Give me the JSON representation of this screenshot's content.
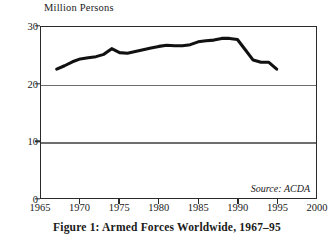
{
  "figure": {
    "caption": "Figure 1: Armed Forces Worldwide, 1967–95",
    "source_note": "Source: ACDA",
    "y_axis_caption": "Million Persons"
  },
  "colors": {
    "line": "#111111",
    "frame": "#2a2a2a",
    "gridline": "#6e6e6e",
    "background": "#ffffff"
  },
  "chart_data": {
    "type": "line",
    "subtitle": "",
    "xlabel": "",
    "ylabel": "Million Persons",
    "annotations": [
      "Source: ACDA"
    ],
    "grid": true,
    "legend": "none",
    "xlim": [
      1965,
      2000
    ],
    "ylim": [
      0,
      30
    ],
    "xticks": [
      1965,
      1970,
      1975,
      1980,
      1985,
      1990,
      1995,
      2000
    ],
    "xtick_labels": [
      "1965",
      "1970",
      "1975",
      "1980",
      "1985",
      "1990",
      "1995",
      "2000"
    ],
    "yticks": [
      0,
      10,
      20,
      30
    ],
    "ytick_labels": [
      "0",
      "10",
      "20",
      "30"
    ],
    "x": [
      1967,
      1968,
      1969,
      1970,
      1971,
      1972,
      1973,
      1974,
      1975,
      1976,
      1977,
      1978,
      1979,
      1980,
      1981,
      1982,
      1983,
      1984,
      1985,
      1986,
      1987,
      1988,
      1989,
      1990,
      1991,
      1992,
      1993,
      1994,
      1995
    ],
    "series": [
      {
        "name": "Armed Forces Worldwide",
        "units": "million persons",
        "values": [
          22.6,
          23.2,
          23.9,
          24.4,
          24.6,
          24.8,
          25.2,
          26.2,
          25.5,
          25.4,
          25.7,
          26.0,
          26.3,
          26.6,
          26.8,
          26.7,
          26.7,
          26.9,
          27.4,
          27.6,
          27.7,
          28.0,
          28.0,
          27.8,
          26.0,
          24.2,
          23.8,
          23.8,
          22.6
        ]
      }
    ]
  }
}
